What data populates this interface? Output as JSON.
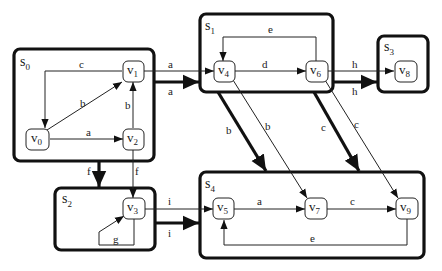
{
  "diagram": {
    "type": "hierarchical-state-graph",
    "sets": [
      {
        "id": "s0",
        "name": "s",
        "sub": "0",
        "nodes": [
          "v0",
          "v1",
          "v2"
        ]
      },
      {
        "id": "s1",
        "name": "s",
        "sub": "1",
        "nodes": [
          "v4",
          "v6"
        ]
      },
      {
        "id": "s2",
        "name": "s",
        "sub": "2",
        "nodes": [
          "v3"
        ]
      },
      {
        "id": "s3",
        "name": "s",
        "sub": "3",
        "nodes": [
          "v8"
        ]
      },
      {
        "id": "s4",
        "name": "s",
        "sub": "4",
        "nodes": [
          "v5",
          "v7",
          "v9"
        ]
      }
    ],
    "nodes": [
      {
        "id": "v0",
        "name": "v",
        "sub": "0"
      },
      {
        "id": "v1",
        "name": "v",
        "sub": "1"
      },
      {
        "id": "v2",
        "name": "v",
        "sub": "2"
      },
      {
        "id": "v3",
        "name": "v",
        "sub": "3"
      },
      {
        "id": "v4",
        "name": "v",
        "sub": "4"
      },
      {
        "id": "v5",
        "name": "v",
        "sub": "5"
      },
      {
        "id": "v6",
        "name": "v",
        "sub": "6"
      },
      {
        "id": "v7",
        "name": "v",
        "sub": "7"
      },
      {
        "id": "v8",
        "name": "v",
        "sub": "8"
      },
      {
        "id": "v9",
        "name": "v",
        "sub": "9"
      }
    ],
    "edges": [
      {
        "from": "v1",
        "to": "v0",
        "label": "c",
        "kind": "thin"
      },
      {
        "from": "v0",
        "to": "v1",
        "label": "b",
        "kind": "thin"
      },
      {
        "from": "v0",
        "to": "v2",
        "label": "a",
        "kind": "thin"
      },
      {
        "from": "v2",
        "to": "v1",
        "label": "b",
        "kind": "thin"
      },
      {
        "from": "v1",
        "to": "v4",
        "label": "a",
        "kind": "thin"
      },
      {
        "from": "s0",
        "to": "s1",
        "label": "a",
        "kind": "thick"
      },
      {
        "from": "v4",
        "to": "v6",
        "label": "d",
        "kind": "thin"
      },
      {
        "from": "v6",
        "to": "v4",
        "label": "e",
        "kind": "thin"
      },
      {
        "from": "v6",
        "to": "v8",
        "label": "h",
        "kind": "thin"
      },
      {
        "from": "s1",
        "to": "s3",
        "label": "h",
        "kind": "thick"
      },
      {
        "from": "s1",
        "to": "s4",
        "label": "b",
        "kind": "thick"
      },
      {
        "from": "v4",
        "to": "v7",
        "label": "b",
        "kind": "thin"
      },
      {
        "from": "s1",
        "to": "s4",
        "label": "c",
        "kind": "thick"
      },
      {
        "from": "v6",
        "to": "v9",
        "label": "c",
        "kind": "thin"
      },
      {
        "from": "s0",
        "to": "s2",
        "label": "f",
        "kind": "thick"
      },
      {
        "from": "v2",
        "to": "v3",
        "label": "f",
        "kind": "thin"
      },
      {
        "from": "v3",
        "to": "v3",
        "label": "g",
        "kind": "thin"
      },
      {
        "from": "v3",
        "to": "v5",
        "label": "i",
        "kind": "thin"
      },
      {
        "from": "s2",
        "to": "s4",
        "label": "i",
        "kind": "thick"
      },
      {
        "from": "v5",
        "to": "v7",
        "label": "a",
        "kind": "thin"
      },
      {
        "from": "v7",
        "to": "v9",
        "label": "c",
        "kind": "thin"
      },
      {
        "from": "v9",
        "to": "v5",
        "label": "e",
        "kind": "thin"
      }
    ]
  },
  "labels": {
    "s0": "s",
    "s0_sub": "0",
    "s1": "s",
    "s1_sub": "1",
    "s2": "s",
    "s2_sub": "2",
    "s3": "s",
    "s3_sub": "3",
    "s4": "s",
    "s4_sub": "4",
    "v0": "v",
    "v0_sub": "0",
    "v1": "v",
    "v1_sub": "1",
    "v2": "v",
    "v2_sub": "2",
    "v3": "v",
    "v3_sub": "3",
    "v4": "v",
    "v4_sub": "4",
    "v5": "v",
    "v5_sub": "5",
    "v6": "v",
    "v6_sub": "6",
    "v7": "v",
    "v7_sub": "7",
    "v8": "v",
    "v8_sub": "8",
    "v9": "v",
    "v9_sub": "9",
    "e_v1_v0": "c",
    "e_v0_v1": "b",
    "e_v0_v2": "a",
    "e_v2_v1": "b",
    "e_v1_v4": "a",
    "e_s0_s1": "a",
    "e_v4_v6": "d",
    "e_v6_v4": "e",
    "e_v6_v8": "h",
    "e_s1_s3": "h",
    "e_s1_s4_b": "b",
    "e_v4_v7": "b",
    "e_s1_s4_c": "c",
    "e_v6_v9": "c",
    "e_s0_s2": "f",
    "e_v2_v3": "f",
    "e_v3_v3": "g",
    "e_v3_v5": "i",
    "e_s2_s4": "i",
    "e_v5_v7": "a",
    "e_v7_v9": "c",
    "e_v9_v5": "e"
  }
}
